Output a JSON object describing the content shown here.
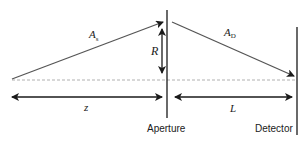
{
  "diagram": {
    "type": "optical-geometry",
    "colors": {
      "line": "#1a1a1a",
      "ray": "#555555",
      "axis_dashed": "#b0b0b0",
      "background": "#ffffff"
    },
    "elements": {
      "aperture": {
        "label": "Aperture"
      },
      "detector": {
        "label": "Detector"
      }
    },
    "rays": {
      "source_ray": {
        "symbol": "A",
        "subscript": "s"
      },
      "detector_ray": {
        "symbol": "A",
        "subscript": "D"
      }
    },
    "dimensions": {
      "radius": {
        "symbol": "R"
      },
      "source_distance": {
        "symbol": "z"
      },
      "detector_distance": {
        "symbol": "L"
      }
    }
  }
}
